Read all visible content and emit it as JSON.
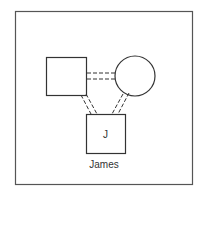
{
  "diagram": {
    "type": "genogram",
    "frame": {
      "x": 15,
      "y": 11,
      "width": 178,
      "height": 174,
      "stroke": "#555555"
    },
    "nodes": [
      {
        "id": "father",
        "shape": "square",
        "x": 46,
        "y": 57,
        "size": 40,
        "label": ""
      },
      {
        "id": "mother",
        "shape": "circle",
        "cx": 135,
        "cy": 76,
        "r": 20,
        "label": ""
      },
      {
        "id": "child",
        "shape": "square",
        "x": 86,
        "y": 114,
        "size": 39,
        "initial": "J",
        "name": "James"
      }
    ],
    "edges": [
      {
        "from": "father",
        "to": "mother",
        "style": "double-dashed",
        "relation": "partnership"
      },
      {
        "from": "father",
        "to": "child",
        "style": "double-dashed",
        "relation": "parent-child"
      },
      {
        "from": "mother",
        "to": "child",
        "style": "double-dashed",
        "relation": "parent-child"
      }
    ],
    "stroke_color": "#333333"
  },
  "child": {
    "initial": "J",
    "name": "James"
  }
}
